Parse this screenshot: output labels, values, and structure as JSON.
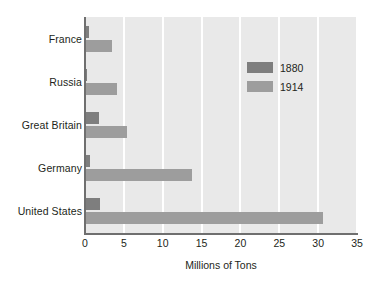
{
  "chart_data": {
    "type": "bar",
    "orientation": "horizontal",
    "title": "",
    "xlabel": "Millions of Tons",
    "ylabel": "",
    "xlim": [
      0,
      35
    ],
    "xticks": [
      0,
      5,
      10,
      15,
      20,
      25,
      30,
      35
    ],
    "xtick_labels": [
      "0",
      "5",
      "10",
      "15",
      "20",
      "25",
      "30",
      "35"
    ],
    "grid": "vertical-white-gridlines-at-xticks",
    "legend_position": "upper-right-inside",
    "categories": [
      "France",
      "Russia",
      "Great Britain",
      "Germany",
      "United States"
    ],
    "series": [
      {
        "name": "1880",
        "color": "#7e7e7e",
        "values": [
          0.5,
          0.3,
          1.8,
          0.7,
          1.9
        ]
      },
      {
        "name": "1914",
        "color": "#9d9d9d",
        "values": [
          3.5,
          4.1,
          5.4,
          13.8,
          30.6
        ]
      }
    ],
    "plot_background": "#e9e9e9",
    "axis_color": "#6f6f6f"
  },
  "legend": {
    "items": [
      {
        "label": "1880",
        "swatch": "s1880"
      },
      {
        "label": "1914",
        "swatch": "s1914"
      }
    ]
  },
  "axis": {
    "x_title": "Millions of Tons"
  }
}
